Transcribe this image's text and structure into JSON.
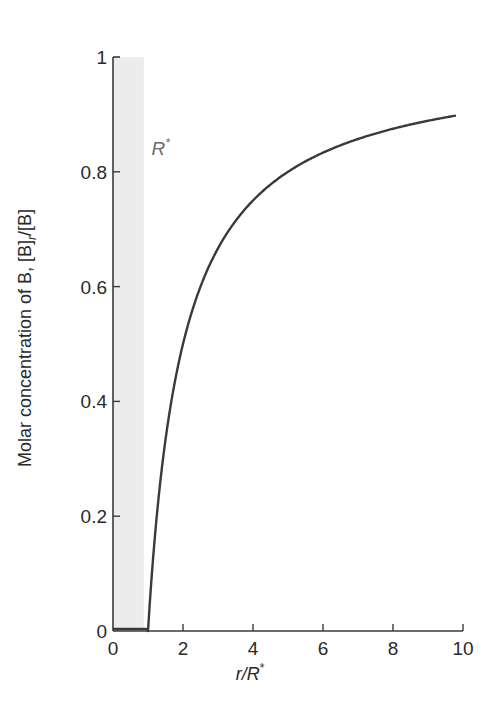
{
  "chart_data": {
    "type": "line",
    "title": "",
    "xlabel": "r/R*",
    "ylabel": "Molar concentration of B, [B]r/[B]",
    "xlim": [
      0,
      10
    ],
    "ylim": [
      0,
      1
    ],
    "x_ticks": [
      0,
      2,
      4,
      6,
      8,
      10
    ],
    "y_ticks": [
      0,
      0.2,
      0.4,
      0.6,
      0.8,
      1
    ],
    "y_tick_labels": [
      "0",
      "0.2",
      "0.4",
      "0.6",
      "0.8",
      "1"
    ],
    "grid": false,
    "legend": null,
    "shaded_region": {
      "x_from": 0,
      "x_to": 0.88,
      "label": "R*",
      "color": "#ececec"
    },
    "series": [
      {
        "name": "[B]r/[B]",
        "color": "#3a3a3a",
        "x": [
          0,
          0.95,
          1.0,
          1.25,
          1.5,
          2.0,
          2.5,
          3.0,
          4.0,
          5.0,
          6.0,
          7.0,
          8.0,
          9.0,
          9.8
        ],
        "y": [
          0,
          0,
          0.0,
          0.2,
          0.333,
          0.5,
          0.6,
          0.667,
          0.75,
          0.8,
          0.833,
          0.857,
          0.875,
          0.889,
          0.898
        ]
      }
    ],
    "annotations": [
      {
        "text": "R*",
        "x": 1.1,
        "y": 0.83
      }
    ]
  },
  "labels": {
    "xlabel_main": "r/R",
    "xlabel_sup": "*",
    "ylabel_main": "Molar concentration of B, [B]",
    "ylabel_sub": "r",
    "ylabel_tail": "/[B]",
    "annot_main": "R",
    "annot_sup": "*"
  }
}
